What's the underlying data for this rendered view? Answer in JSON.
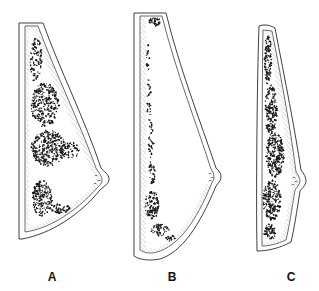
{
  "figure": {
    "panels": [
      {
        "id": "A",
        "label": "A",
        "label_pos": [
          52,
          279
        ],
        "outer": "M19,23 L43,23 C60,70 85,120 101,168 C104,172 109,174 109,179 C109,184 104,186 100,190 C80,215 50,234 22,239 L19,239 Z",
        "inner": "M25,26 L38,26 C55,72 79,121 96,168 C99,173 102,176 102,180 C102,184 99,186 96,189 C76,212 48,229 25,232 Z",
        "hatch_band": "M25,26 L38,26 C55,72 79,121 96,168 C99,173 102,176 102,180 C102,184 99,186 96,189 C76,212 48,229 25,232 L25,228 C47,225 72,208 91,188 C95,184 96,182 96,180 C96,177 94,174 91,170 C74,124 50,76 33,30 L29,30 L29,226 L25,228 Z",
        "nipple_marks": [
          [
            96,
            176
          ],
          [
            99,
            181
          ],
          [
            95,
            184
          ]
        ],
        "density": [
          {
            "cx": 36,
            "cy": 60,
            "rx": 6,
            "ry": 22,
            "n": 90
          },
          {
            "cx": 45,
            "cy": 105,
            "rx": 14,
            "ry": 22,
            "n": 260
          },
          {
            "cx": 48,
            "cy": 148,
            "rx": 17,
            "ry": 18,
            "n": 300
          },
          {
            "cx": 70,
            "cy": 150,
            "rx": 10,
            "ry": 8,
            "n": 60
          },
          {
            "cx": 42,
            "cy": 198,
            "rx": 10,
            "ry": 18,
            "n": 170
          },
          {
            "cx": 60,
            "cy": 208,
            "rx": 10,
            "ry": 5,
            "n": 45
          }
        ]
      },
      {
        "id": "B",
        "label": "B",
        "label_pos": [
          172,
          279
        ],
        "outer": "M134,13 L166,13 C180,70 200,120 216,168 C219,171 221,173 221,177 C221,181 218,183 216,186 C200,225 182,252 160,259 C150,261 140,260 134,256 Z",
        "inner": "M140,16 L162,16 C176,72 196,122 211,169 C213,172 214,174 214,177 C214,180 212,182 211,185 C196,222 178,246 157,252 C150,254 145,253 140,250 Z",
        "hatch_band": "M140,16 L146,16 L146,246 C150,249 153,249 157,248 C175,242 192,220 206,184 L211,185 C196,222 178,246 157,252 C150,254 145,253 140,250 Z",
        "nipple_marks": [
          [
            210,
            174
          ],
          [
            212,
            178
          ],
          [
            210,
            181
          ]
        ],
        "density": [
          {
            "cx": 155,
            "cy": 22,
            "rx": 7,
            "ry": 4,
            "n": 35
          },
          {
            "cx": 148,
            "cy": 60,
            "rx": 1.5,
            "ry": 18,
            "n": 18
          },
          {
            "cx": 149,
            "cy": 100,
            "rx": 2,
            "ry": 22,
            "n": 26
          },
          {
            "cx": 151,
            "cy": 140,
            "rx": 2.5,
            "ry": 20,
            "n": 30
          },
          {
            "cx": 152,
            "cy": 172,
            "rx": 3,
            "ry": 12,
            "n": 28
          },
          {
            "cx": 152,
            "cy": 205,
            "rx": 7,
            "ry": 14,
            "n": 110
          },
          {
            "cx": 160,
            "cy": 230,
            "rx": 9,
            "ry": 6,
            "n": 55
          },
          {
            "cx": 170,
            "cy": 238,
            "rx": 5,
            "ry": 3,
            "n": 15
          }
        ]
      },
      {
        "id": "C",
        "label": "C",
        "label_pos": [
          291,
          279
        ],
        "outer": "M259,26 C264,24 270,25 275,28 C285,80 295,130 301,170 C304,174 306,177 306,181 C306,185 302,188 300,191 C297,210 294,230 291,242 C280,248 268,251 257,251 C256,200 257,80 259,26 Z",
        "inner": "M263,30 L272,31 C282,82 291,132 296,172 C298,175 300,178 300,181 C300,184 297,187 295,190 C292,208 289,228 286,240 C277,244 269,246 262,246 C262,200 262,80 263,30 Z",
        "hatch_band": "M263,30 L272,31 C282,82 291,132 296,172 C298,175 300,178 300,181 C300,184 297,187 295,190 C292,208 289,228 286,240 C277,244 269,246 262,246 L263,242 C270,242 277,240 282,236 C285,224 288,206 291,189 C294,185 295,183 295,181 C295,179 293,176 291,173 C285,133 276,84 268,34 L263,34 Z",
        "nipple_marks": [
          [
            294,
            178
          ],
          [
            296,
            182
          ],
          [
            293,
            185
          ]
        ],
        "density": [
          {
            "cx": 268,
            "cy": 60,
            "rx": 4,
            "ry": 25,
            "n": 110
          },
          {
            "cx": 271,
            "cy": 110,
            "rx": 6,
            "ry": 25,
            "n": 170
          },
          {
            "cx": 275,
            "cy": 155,
            "rx": 9,
            "ry": 22,
            "n": 240
          },
          {
            "cx": 272,
            "cy": 200,
            "rx": 9,
            "ry": 20,
            "n": 200
          },
          {
            "cx": 270,
            "cy": 232,
            "rx": 6,
            "ry": 8,
            "n": 60
          }
        ]
      }
    ],
    "colors": {
      "ink": "#1a1a1a",
      "line": "#2a2a2a",
      "hatch": "#9a9a9a",
      "background": "#ffffff"
    }
  }
}
